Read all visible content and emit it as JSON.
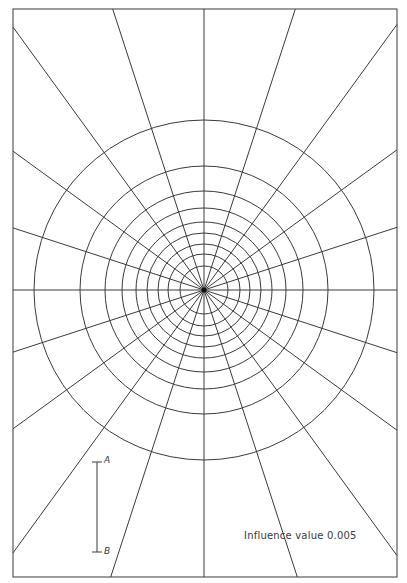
{
  "chart_data": {
    "type": "influence-chart",
    "influence_value": 0.005,
    "influence_label": "Influence value 0.005",
    "frame": {
      "x0": 13,
      "y0": 9,
      "x1": 397,
      "y1": 577
    },
    "center": {
      "x": 204,
      "y": 290
    },
    "rings": {
      "count": 9,
      "radii_px": [
        24,
        36,
        46,
        57,
        68,
        82,
        99,
        124,
        170
      ]
    },
    "radial_lines": {
      "count": 20,
      "angle_step_deg": 18
    },
    "scale_bar": {
      "label_top": "A",
      "label_bottom": "B",
      "x": 97,
      "y_top": 462,
      "y_bottom": 552,
      "meaning": "depth z"
    }
  },
  "labels": {
    "influence": "Influence value 0.005",
    "a": "A",
    "b": "B"
  },
  "colors": {
    "line": "#3a3a3a",
    "background": "#ffffff"
  }
}
